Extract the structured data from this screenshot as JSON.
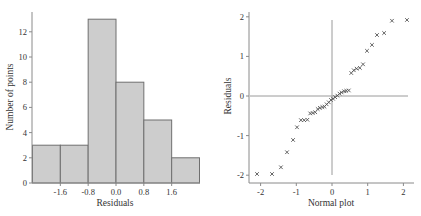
{
  "chart_data": [
    {
      "type": "bar",
      "subtype": "histogram",
      "title": "",
      "xlabel": "Residuals",
      "ylabel": "Number of points",
      "bin_edges": [
        -2.4,
        -1.6,
        -0.8,
        0.0,
        0.8,
        1.6,
        2.4
      ],
      "values": [
        3,
        3,
        13,
        8,
        5,
        2
      ],
      "x_tick_labels": [
        "-1.6",
        "-0.8",
        "0.0",
        "0.8",
        "1.6"
      ],
      "x_ticks": [
        -1.6,
        -0.8,
        0.0,
        0.8,
        1.6
      ],
      "y_ticks": [
        0,
        2,
        4,
        6,
        8,
        10,
        12
      ],
      "y_tick_labels": [
        "0",
        "2",
        "4",
        "6",
        "8",
        "10",
        "12"
      ],
      "ylim": [
        0,
        13.6
      ],
      "xlim": [
        -2.4,
        2.4
      ],
      "grid": false,
      "colors": {
        "bar_fill": "#cdcdcd",
        "bar_edge": "#6f6f6f"
      }
    },
    {
      "type": "scatter",
      "subtype": "normal probability plot",
      "title": "",
      "xlabel": "Normal plot",
      "ylabel": "Residuals",
      "marker": "x",
      "x_ticks": [
        -2,
        -1,
        0,
        1,
        2
      ],
      "x_tick_labels": [
        "-2",
        "-1",
        "0",
        "1",
        "2"
      ],
      "y_ticks": [
        -2,
        -1,
        0,
        1,
        2
      ],
      "y_tick_labels": [
        "-2",
        "-1",
        "0",
        "1",
        "2"
      ],
      "xlim": [
        -2.3,
        2.3
      ],
      "ylim": [
        -2.2,
        2.2
      ],
      "reference_lines": {
        "x": 0,
        "y": 0
      },
      "grid": false,
      "points": [
        {
          "x": -2.1,
          "y": -1.97
        },
        {
          "x": -1.68,
          "y": -1.97
        },
        {
          "x": -1.43,
          "y": -1.8
        },
        {
          "x": -1.26,
          "y": -1.42
        },
        {
          "x": -1.09,
          "y": -1.11
        },
        {
          "x": -0.98,
          "y": -0.79
        },
        {
          "x": -0.87,
          "y": -0.61
        },
        {
          "x": -0.78,
          "y": -0.61
        },
        {
          "x": -0.69,
          "y": -0.6
        },
        {
          "x": -0.61,
          "y": -0.44
        },
        {
          "x": -0.54,
          "y": -0.43
        },
        {
          "x": -0.47,
          "y": -0.41
        },
        {
          "x": -0.4,
          "y": -0.33
        },
        {
          "x": -0.34,
          "y": -0.3
        },
        {
          "x": -0.27,
          "y": -0.28
        },
        {
          "x": -0.21,
          "y": -0.27
        },
        {
          "x": -0.15,
          "y": -0.21
        },
        {
          "x": -0.09,
          "y": -0.16
        },
        {
          "x": -0.03,
          "y": -0.1
        },
        {
          "x": 0.03,
          "y": -0.07
        },
        {
          "x": 0.09,
          "y": -0.03
        },
        {
          "x": 0.15,
          "y": 0.01
        },
        {
          "x": 0.21,
          "y": 0.06
        },
        {
          "x": 0.27,
          "y": 0.09
        },
        {
          "x": 0.34,
          "y": 0.12
        },
        {
          "x": 0.4,
          "y": 0.13
        },
        {
          "x": 0.47,
          "y": 0.14
        },
        {
          "x": 0.54,
          "y": 0.58
        },
        {
          "x": 0.61,
          "y": 0.65
        },
        {
          "x": 0.69,
          "y": 0.69
        },
        {
          "x": 0.78,
          "y": 0.71
        },
        {
          "x": 0.87,
          "y": 0.8
        },
        {
          "x": 0.98,
          "y": 1.14
        },
        {
          "x": 1.12,
          "y": 1.29
        },
        {
          "x": 1.26,
          "y": 1.54
        },
        {
          "x": 1.46,
          "y": 1.59
        },
        {
          "x": 1.68,
          "y": 1.9
        },
        {
          "x": 2.1,
          "y": 1.92
        }
      ],
      "colors": {
        "marker": "#555555",
        "reference": "#9a9a9a"
      }
    }
  ],
  "labels": {
    "hist_xlabel": "Residuals",
    "hist_ylabel": "Number of points",
    "qq_xlabel": "Normal plot",
    "qq_ylabel": "Residuals"
  }
}
